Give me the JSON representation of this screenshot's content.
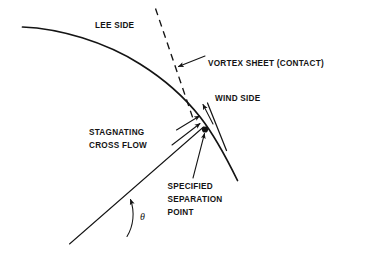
{
  "figure": {
    "title_text": "",
    "background_color": "#ffffff",
    "ink_color": "#141414",
    "width": 371,
    "height": 257
  },
  "labels": {
    "lee_side": "LEE SIDE",
    "vortex_sheet": "VORTEX SHEET (CONTACT)",
    "wind_side": "WIND SIDE",
    "stagnating_line1": "STAGNATING",
    "stagnating_line2": "CROSS FLOW",
    "separation_line1": "SPECIFIED",
    "separation_line2": "SEPARATION",
    "separation_line3": "POINT",
    "theta_symbol": "θ"
  },
  "geometry": {
    "body_curve_note": "cross-section contour of body, lee side upper-left to wind side lower-right",
    "vortex_sheet_note": "dashed line leaving body at separation region",
    "shear_layer_note": "short solid segment springing from separation point",
    "radial_ray_note": "straight ray from body axis origin to specified separation point",
    "angle_arc_note": "arc marking angle theta between reference line and radial ray"
  }
}
